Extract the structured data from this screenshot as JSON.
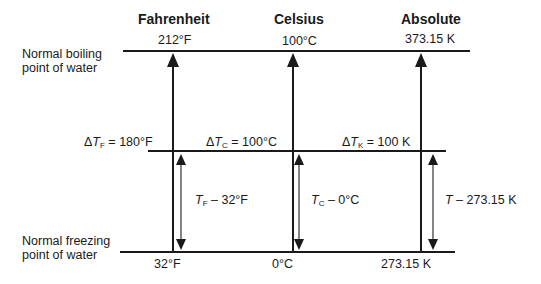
{
  "columns": [
    {
      "header": "Fahrenheit",
      "boiling": "212°F",
      "freezing": "32°F",
      "delta_sym": "T",
      "delta_sub": "F",
      "delta_val": " = 180°F",
      "rel_sym": "T",
      "rel_sub": "F",
      "rel_val": " – 32°F"
    },
    {
      "header": "Celsius",
      "boiling": "100°C",
      "freezing": "0°C",
      "delta_sym": "T",
      "delta_sub": "C",
      "delta_val": " = 100°C",
      "rel_sym": "T",
      "rel_sub": "C",
      "rel_val": " – 0°C"
    },
    {
      "header": "Absolute",
      "boiling": "373.15 K",
      "freezing": "273.15 K",
      "delta_sym": "T",
      "delta_sub": "K",
      "delta_val": " = 100 K",
      "rel_sym": "T",
      "rel_sub": "",
      "rel_val": " – 273.15 K"
    }
  ],
  "row_labels": {
    "boiling_1": "Normal boiling",
    "boiling_2": "point of water",
    "freezing_1": "Normal freezing",
    "freezing_2": "point of water"
  },
  "delta_glyph": "Δ"
}
